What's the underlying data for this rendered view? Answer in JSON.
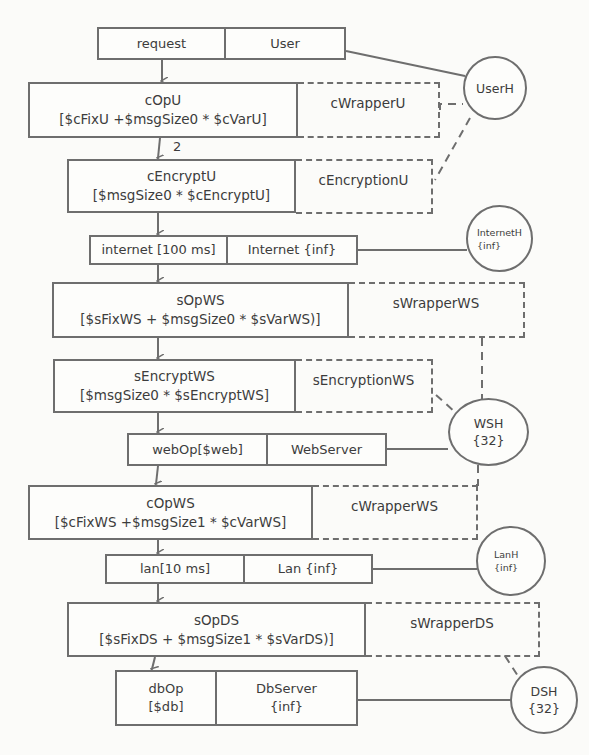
{
  "diagram": {
    "type": "layered-queueing-network",
    "request_task": {
      "entry": "request",
      "task": "User"
    },
    "activities": [
      {
        "id": "cOpU",
        "name": "cOpU",
        "formula": "[$cFixU +$msgSize0 * $cVarU]",
        "wrapper": "cWrapperU"
      },
      {
        "id": "cEncryptU",
        "name": "cEncryptU",
        "formula": "[$msgSize0 * $cEncryptU]",
        "wrapper": "cEncryptionU"
      },
      {
        "id": "sOpWS",
        "name": "sOpWS",
        "formula": "[$sFixWS + $msgSize0 * $sVarWS)]",
        "wrapper": "sWrapperWS"
      },
      {
        "id": "sEncryptWS",
        "name": "sEncryptWS",
        "formula": "[$msgSize0 * $sEncryptWS]",
        "wrapper": "sEncryptionWS"
      },
      {
        "id": "cOpWS",
        "name": "cOpWS",
        "formula": "[$cFixWS +$msgSize1 * $cVarWS]",
        "wrapper": "cWrapperWS"
      },
      {
        "id": "sOpDS",
        "name": "sOpDS",
        "formula": "[$sFixDS + $msgSize1 * $sVarDS)]",
        "wrapper": "sWrapperDS"
      }
    ],
    "tasks": [
      {
        "id": "internet",
        "entry": "internet [100 ms]",
        "task": "Internet {inf}"
      },
      {
        "id": "web",
        "entry": "webOp[$web]",
        "task": "WebServer"
      },
      {
        "id": "lan",
        "entry": "lan[10 ms]",
        "task": "Lan {inf}"
      },
      {
        "id": "db",
        "entry_line1": "dbOp",
        "entry_line2": "[$db]",
        "task_line1": "DbServer",
        "task_line2": "{inf}"
      }
    ],
    "hosts": [
      {
        "id": "UserH",
        "name": "UserH",
        "mult": ""
      },
      {
        "id": "InternetH",
        "name": "InternetH",
        "mult": "{inf}"
      },
      {
        "id": "WSH",
        "name": "WSH",
        "mult": "{32}"
      },
      {
        "id": "LanH",
        "name": "LanH",
        "mult": "{inf}"
      },
      {
        "id": "DSH",
        "name": "DSH",
        "mult": "{32}"
      }
    ],
    "edge_labels": {
      "cOpU_to_cEncryptU": "2"
    },
    "colors": {
      "line": "#6e6e6e",
      "text": "#3c3c3c",
      "background": "#fbfbf9"
    }
  }
}
